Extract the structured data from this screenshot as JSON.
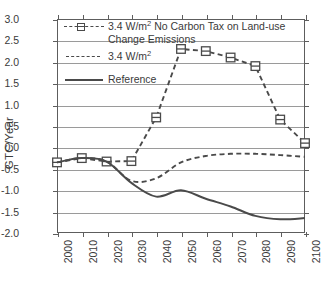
{
  "chart_data": {
    "type": "line",
    "title": "",
    "xlabel": "",
    "ylabel": "GTC/Year",
    "xlim": [
      2000,
      2100
    ],
    "ylim": [
      -2.0,
      3.0
    ],
    "ytick_step": 0.5,
    "xtick_step": 10,
    "grid": true,
    "legend_position": "upper-left-inside",
    "x": [
      2000,
      2010,
      2020,
      2030,
      2040,
      2050,
      2060,
      2070,
      2080,
      2090,
      2100
    ],
    "xticklabels": [
      "2000",
      "2010",
      "2020",
      "2030",
      "2040",
      "2050",
      "2060",
      "2070",
      "2080",
      "2090",
      "2100"
    ],
    "yticklabels": [
      "3.0",
      "2.5",
      "2.0",
      "1.5",
      "1.0",
      "0.5",
      "0.0",
      "-0.5",
      "-1.0",
      "-1.5",
      "-2.0"
    ],
    "series": [
      {
        "name": "3.4 W/m2 No Carbon Tax on Land-use Change Emissions",
        "style": "dashed-square-markers",
        "marker": "square",
        "color": "#4a4a4a",
        "values": [
          -0.35,
          -0.25,
          -0.33,
          -0.32,
          0.7,
          2.3,
          2.25,
          2.1,
          1.9,
          0.65,
          0.1
        ]
      },
      {
        "name": "3.4 W/m2",
        "style": "dashed",
        "marker": "none",
        "color": "#4a4a4a",
        "values": [
          -0.35,
          -0.25,
          -0.33,
          -0.78,
          -0.72,
          -0.35,
          -0.2,
          -0.15,
          -0.15,
          -0.18,
          -0.22
        ]
      },
      {
        "name": "Reference",
        "style": "solid",
        "marker": "none",
        "color": "#4a4a4a",
        "values": [
          -0.35,
          -0.25,
          -0.33,
          -0.83,
          -1.15,
          -1.0,
          -1.2,
          -1.38,
          -1.6,
          -1.68,
          -1.65
        ]
      }
    ]
  },
  "legend": {
    "items": [
      {
        "key": "dashed-square",
        "label_pre": "3.4 W/m",
        "label_sup": "2",
        "label_post": " No Carbon Tax on Land-use",
        "label_line2": "Change Emissions"
      },
      {
        "key": "dashed",
        "label_pre": "3.4 W/m",
        "label_sup": "2",
        "label_post": "",
        "label_line2": ""
      },
      {
        "key": "solid",
        "label_pre": "Reference",
        "label_sup": "",
        "label_post": "",
        "label_line2": ""
      }
    ]
  },
  "axis": {
    "y_title": "GTC/Year"
  }
}
